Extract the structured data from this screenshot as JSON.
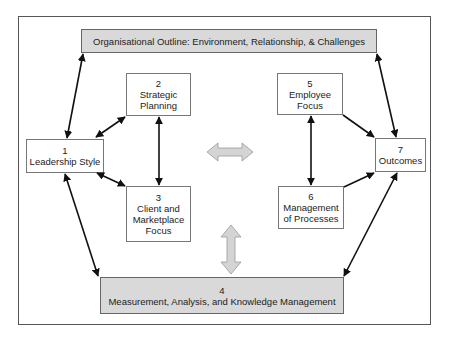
{
  "diagram": {
    "top_banner": {
      "text": "Organisational Outline: Environment, Relationship, & Challenges"
    },
    "boxes": [
      {
        "number": "1",
        "label": "Leadership Style"
      },
      {
        "number": "2",
        "label_lines": [
          "Strategic",
          "Planning"
        ]
      },
      {
        "number": "3",
        "label_lines": [
          "Client and",
          "Marketplace",
          "Focus"
        ]
      },
      {
        "number": "4",
        "label": "Measurement, Analysis, and Knowledge Management"
      },
      {
        "number": "5",
        "label_lines": [
          "Employee",
          "Focus"
        ]
      },
      {
        "number": "6",
        "label_lines": [
          "Management",
          "of Processes"
        ]
      },
      {
        "number": "7",
        "label": "Outcomes"
      }
    ],
    "colors": {
      "shaded_fill": "#d9d9d9",
      "block_arrow_fill": "#d4d4d4",
      "line": "#111111"
    }
  }
}
